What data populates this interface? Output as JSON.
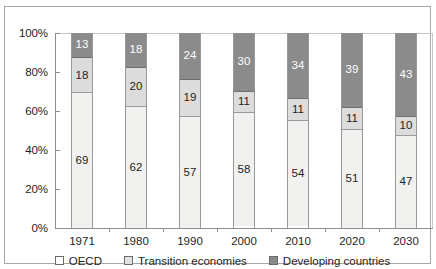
{
  "chart_data": {
    "type": "bar",
    "stacked": true,
    "stack_mode": "percent",
    "title": "",
    "xlabel": "",
    "ylabel": "",
    "ylim": [
      0,
      100
    ],
    "yticks": [
      "0%",
      "20%",
      "40%",
      "60%",
      "80%",
      "100%"
    ],
    "ytick_values": [
      0,
      20,
      40,
      60,
      80,
      100
    ],
    "grid": false,
    "legend_position": "bottom",
    "categories": [
      "1971",
      "1980",
      "1990",
      "2000",
      "2010",
      "2020",
      "2030"
    ],
    "series": [
      {
        "name": "OECD",
        "color": "#f1f1ef",
        "values": [
          69,
          62,
          57,
          58,
          54,
          51,
          47
        ]
      },
      {
        "name": "Transition economies",
        "color": "#dcdcdc",
        "values": [
          18,
          20,
          19,
          11,
          11,
          11,
          10
        ]
      },
      {
        "name": "Developing countries",
        "color": "#8b8b8b",
        "values": [
          13,
          18,
          24,
          30,
          34,
          39,
          43
        ]
      }
    ]
  },
  "axis": {
    "yticks": [
      {
        "label": "100%",
        "value": 100
      },
      {
        "label": "80%",
        "value": 80
      },
      {
        "label": "60%",
        "value": 60
      },
      {
        "label": "40%",
        "value": 40
      },
      {
        "label": "20%",
        "value": 20
      },
      {
        "label": "0%",
        "value": 0
      }
    ],
    "xlabels": [
      "1971",
      "1980",
      "1990",
      "2000",
      "2010",
      "2020",
      "2030"
    ]
  },
  "bars": [
    {
      "category": "1971",
      "segments": [
        {
          "series": "Developing countries",
          "value": 13,
          "label": "13"
        },
        {
          "series": "Transition economies",
          "value": 18,
          "label": "18"
        },
        {
          "series": "OECD",
          "value": 69,
          "label": "69"
        }
      ]
    },
    {
      "category": "1980",
      "segments": [
        {
          "series": "Developing countries",
          "value": 18,
          "label": "18"
        },
        {
          "series": "Transition economies",
          "value": 20,
          "label": "20"
        },
        {
          "series": "OECD",
          "value": 62,
          "label": "62"
        }
      ]
    },
    {
      "category": "1990",
      "segments": [
        {
          "series": "Developing countries",
          "value": 24,
          "label": "24"
        },
        {
          "series": "Transition economies",
          "value": 19,
          "label": "19"
        },
        {
          "series": "OECD",
          "value": 57,
          "label": "57"
        }
      ]
    },
    {
      "category": "2000",
      "segments": [
        {
          "series": "Developing countries",
          "value": 30,
          "label": "30"
        },
        {
          "series": "Transition economies",
          "value": 11,
          "label": "11"
        },
        {
          "series": "OECD",
          "value": 58,
          "label": "58"
        }
      ]
    },
    {
      "category": "2010",
      "segments": [
        {
          "series": "Developing countries",
          "value": 34,
          "label": "34"
        },
        {
          "series": "Transition economies",
          "value": 11,
          "label": "11"
        },
        {
          "series": "OECD",
          "value": 54,
          "label": "54"
        }
      ]
    },
    {
      "category": "2020",
      "segments": [
        {
          "series": "Developing countries",
          "value": 39,
          "label": "39"
        },
        {
          "series": "Transition economies",
          "value": 11,
          "label": "11"
        },
        {
          "series": "OECD",
          "value": 51,
          "label": "51"
        }
      ]
    },
    {
      "category": "2030",
      "segments": [
        {
          "series": "Developing countries",
          "value": 43,
          "label": "43"
        },
        {
          "series": "Transition economies",
          "value": 10,
          "label": "10"
        },
        {
          "series": "OECD",
          "value": 47,
          "label": "47"
        }
      ]
    }
  ],
  "legend": {
    "items": [
      {
        "label": "OECD",
        "swatch_class": "sw-oecd",
        "color": "#ffffff"
      },
      {
        "label": "Transition economies",
        "swatch_class": "sw-transition",
        "color": "#e3e3e3"
      },
      {
        "label": "Developing countries",
        "swatch_class": "sw-developing",
        "color": "#8b8b8b"
      }
    ]
  },
  "colors": {
    "oecd": "#f1f1ef",
    "transition": "#dcdcdc",
    "developing": "#8b8b8b",
    "axis": "#8d8d8d",
    "frame": "#a7a7a7",
    "text": "#231f20"
  }
}
